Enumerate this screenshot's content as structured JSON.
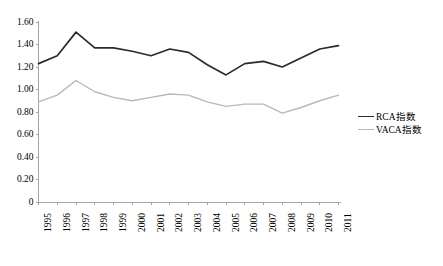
{
  "chart_data": {
    "type": "line",
    "title": "",
    "xlabel": "",
    "ylabel": "",
    "categories": [
      "1995",
      "1996",
      "1997",
      "1998",
      "1999",
      "2000",
      "2001",
      "2002",
      "2003",
      "2004",
      "2005",
      "2006",
      "2007",
      "2008",
      "2009",
      "2010",
      "2011"
    ],
    "series": [
      {
        "name": "RCA指数",
        "color": "#2b2b2b",
        "values": [
          1.23,
          1.3,
          1.51,
          1.37,
          1.37,
          1.34,
          1.3,
          1.36,
          1.33,
          1.22,
          1.13,
          1.23,
          1.25,
          1.2,
          1.28,
          1.36,
          1.39
        ]
      },
      {
        "name": "VACA指数",
        "color": "#b9b9b9",
        "values": [
          0.89,
          0.95,
          1.08,
          0.98,
          0.93,
          0.9,
          0.93,
          0.96,
          0.95,
          0.89,
          0.85,
          0.87,
          0.87,
          0.79,
          0.84,
          0.9,
          0.95
        ]
      }
    ],
    "ylim": [
      0,
      1.6
    ],
    "ytick_values": [
      0,
      0.2,
      0.4,
      0.6,
      0.8,
      1.0,
      1.2,
      1.4,
      1.6
    ],
    "ytick_labels": [
      "0",
      "0.20",
      "0.40",
      "0.60",
      "0.80",
      "1.00",
      "1.20",
      "1.40",
      "1.60"
    ],
    "grid": false,
    "legend_position": "right",
    "xtick_rotation": -90
  },
  "legend": {
    "entries": [
      {
        "label": "RCA指数"
      },
      {
        "label": "VACA指数"
      }
    ]
  },
  "axis": {
    "color": "#a6a6a6"
  }
}
